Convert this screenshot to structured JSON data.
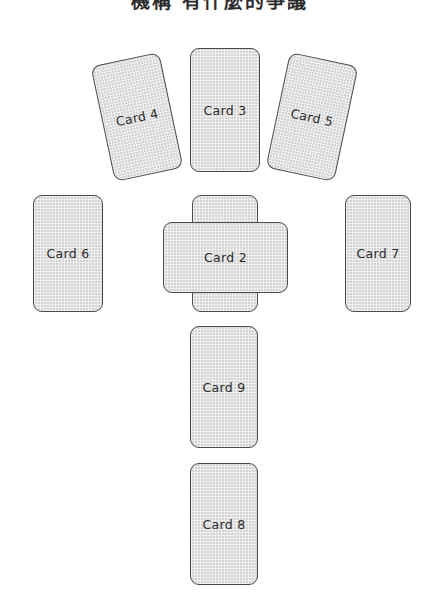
{
  "diagram": {
    "title": "機構 有什麼的爭議",
    "background_color": "#ffffff",
    "card_fill_color": "#d4d4d4",
    "card_border_color": "#4a4a4a",
    "label_color": "#2a2a2a",
    "layout_name": "celtic-cross-spread",
    "card_count": 9
  },
  "cards": [
    {
      "id": "card-1",
      "label": "Card 1",
      "x": 192,
      "y": 195,
      "width": 66,
      "height": 117,
      "rotation": 0,
      "orientation": "portrait"
    },
    {
      "id": "card-2",
      "label": "Card 2",
      "x": 163,
      "y": 222,
      "width": 125,
      "height": 71,
      "rotation": 0,
      "orientation": "landscape"
    },
    {
      "id": "card-3",
      "label": "Card 3",
      "x": 190,
      "y": 48,
      "width": 70,
      "height": 124,
      "rotation": 0,
      "orientation": "portrait"
    },
    {
      "id": "card-4",
      "label": "Card 4",
      "x": 102,
      "y": 58,
      "width": 70,
      "height": 118,
      "rotation": -12,
      "orientation": "portrait"
    },
    {
      "id": "card-5",
      "label": "Card 5",
      "x": 277,
      "y": 58,
      "width": 70,
      "height": 118,
      "rotation": 12,
      "orientation": "portrait"
    },
    {
      "id": "card-6",
      "label": "Card 6",
      "x": 33,
      "y": 195,
      "width": 70,
      "height": 117,
      "rotation": 0,
      "orientation": "portrait"
    },
    {
      "id": "card-7",
      "label": "Card 7",
      "x": 345,
      "y": 195,
      "width": 66,
      "height": 117,
      "rotation": 0,
      "orientation": "portrait"
    },
    {
      "id": "card-8",
      "label": "Card 8",
      "x": 190,
      "y": 463,
      "width": 68,
      "height": 122,
      "rotation": 0,
      "orientation": "portrait"
    },
    {
      "id": "card-9",
      "label": "Card 9",
      "x": 190,
      "y": 326,
      "width": 68,
      "height": 122,
      "rotation": 0,
      "orientation": "portrait"
    }
  ]
}
